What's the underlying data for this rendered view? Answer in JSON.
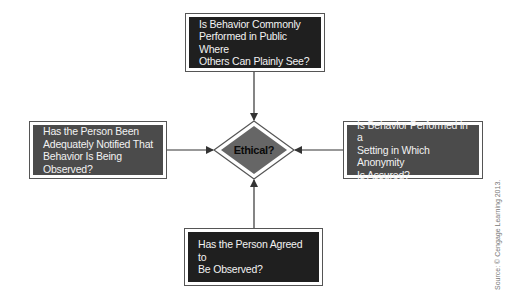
{
  "diagram": {
    "type": "flowchart",
    "center": {
      "label": "Ethical?",
      "shape": "diamond",
      "fill": "#666666"
    },
    "boxes": {
      "top": {
        "text": "Is Behavior Commonly\nPerformed in Public Where\nOthers Can Plainly See?",
        "fill": "#1f1f1f"
      },
      "left": {
        "text": "Has the Person Been\nAdequately Notified That\nBehavior Is Being Observed?",
        "fill": "#4b4b4b"
      },
      "right": {
        "text": "Is Behavior Performed in a\nSetting in Which Anonymity\nIs Assured?",
        "fill": "#4b4b4b"
      },
      "bottom": {
        "text": "Has the Person Agreed to\nBe Observed?",
        "fill": "#1f1f1f"
      }
    },
    "edges": [
      {
        "from": "top",
        "to": "center"
      },
      {
        "from": "left",
        "to": "center"
      },
      {
        "from": "right",
        "to": "center"
      },
      {
        "from": "bottom",
        "to": "center"
      }
    ],
    "source": "Source: © Cengage Learning 2013."
  }
}
